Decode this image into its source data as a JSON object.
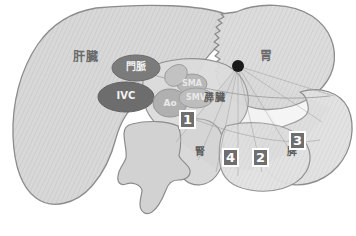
{
  "figure": {
    "background_color": "#ffffff",
    "width": 356,
    "height": 236
  },
  "palette": {
    "organ_fill": "#d6d6d6",
    "organ_fill_light": "#dedede",
    "organ_fill_dark": "#c6c6c6",
    "outline": "#8a8a8a",
    "vessel_dark": "#6d6d6d",
    "vessel_mid": "#9a9a9a",
    "vessel_light": "#b5b5b5",
    "probe_dot": "#1a1a1a",
    "box_fill": "#6e6e6e",
    "box_text": "#ffffff",
    "box_border": "#ffffff",
    "label_text": "#6a6a6a"
  },
  "organs": [
    {
      "id": "liver",
      "label": "肝臓",
      "x": 86,
      "y": 58,
      "font_size": 12
    },
    {
      "id": "stomach",
      "label": "胃",
      "x": 265,
      "y": 57,
      "font_size": 12
    },
    {
      "id": "pancreas",
      "label": "膵臓",
      "x": 213,
      "y": 99,
      "font_size": 10
    },
    {
      "id": "kidney",
      "label": "腎",
      "x": 199,
      "y": 153,
      "font_size": 10
    },
    {
      "id": "spleen",
      "label": "脾",
      "x": 290,
      "y": 153,
      "font_size": 10
    }
  ],
  "vessels": [
    {
      "id": "portal-vein",
      "label": "門脈",
      "x": 136,
      "y": 68,
      "font_size": 10,
      "tone": "light"
    },
    {
      "id": "inferior-vena-cava",
      "label": "IVC",
      "x": 126,
      "y": 97,
      "font_size": 10,
      "tone": "light"
    },
    {
      "id": "aorta",
      "label": "Ao",
      "x": 168,
      "y": 104,
      "font_size": 9,
      "tone": "muted"
    },
    {
      "id": "superior-mesenteric-artery",
      "label": "SMA",
      "x": 190,
      "y": 83,
      "font_size": 8,
      "tone": "muted"
    },
    {
      "id": "superior-mesenteric-vein",
      "label": "SMV",
      "x": 193,
      "y": 97,
      "font_size": 8,
      "tone": "muted"
    }
  ],
  "callouts": [
    {
      "id": "callout-1",
      "number": "1",
      "x": 179,
      "y": 110
    },
    {
      "id": "callout-4",
      "number": "4",
      "x": 222,
      "y": 148
    },
    {
      "id": "callout-2",
      "number": "2",
      "x": 252,
      "y": 148
    },
    {
      "id": "callout-3",
      "number": "3",
      "x": 289,
      "y": 131
    }
  ],
  "probe": {
    "id": "probe-origin",
    "label": "プローブ走査点",
    "x": 238,
    "y": 66,
    "radius": 6
  }
}
